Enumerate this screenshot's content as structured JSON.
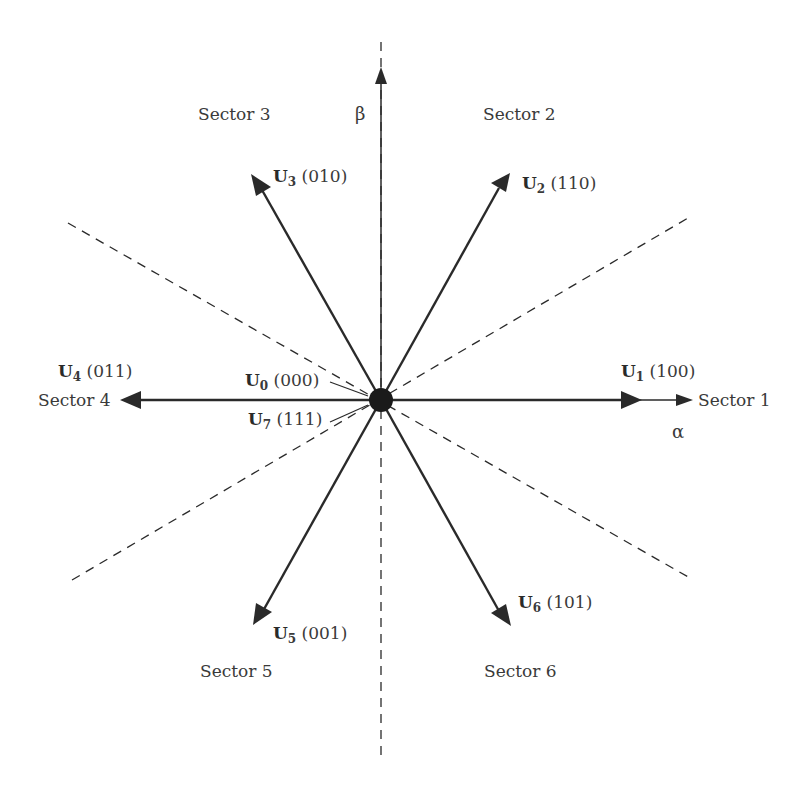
{
  "diagram": {
    "axes": {
      "alpha": "α",
      "beta": "β"
    },
    "sectors": [
      {
        "id": 1,
        "label": "Sector 1"
      },
      {
        "id": 2,
        "label": "Sector 2"
      },
      {
        "id": 3,
        "label": "Sector 3"
      },
      {
        "id": 4,
        "label": "Sector 4"
      },
      {
        "id": 5,
        "label": "Sector 5"
      },
      {
        "id": 6,
        "label": "Sector 6"
      }
    ],
    "vectors": [
      {
        "name": "U",
        "sub": "1",
        "state": "(100)",
        "angle_deg": 0
      },
      {
        "name": "U",
        "sub": "2",
        "state": "(110)",
        "angle_deg": 60
      },
      {
        "name": "U",
        "sub": "3",
        "state": "(010)",
        "angle_deg": 120
      },
      {
        "name": "U",
        "sub": "4",
        "state": "(011)",
        "angle_deg": 180
      },
      {
        "name": "U",
        "sub": "5",
        "state": "(001)",
        "angle_deg": 240
      },
      {
        "name": "U",
        "sub": "6",
        "state": "(101)",
        "angle_deg": 300
      },
      {
        "name": "U",
        "sub": "0",
        "state": "(000)",
        "angle_deg": null
      },
      {
        "name": "U",
        "sub": "7",
        "state": "(111)",
        "angle_deg": null
      }
    ],
    "colors": {
      "line": "#2a2a2a",
      "text": "#3a3a3a",
      "background": "#ffffff"
    }
  }
}
